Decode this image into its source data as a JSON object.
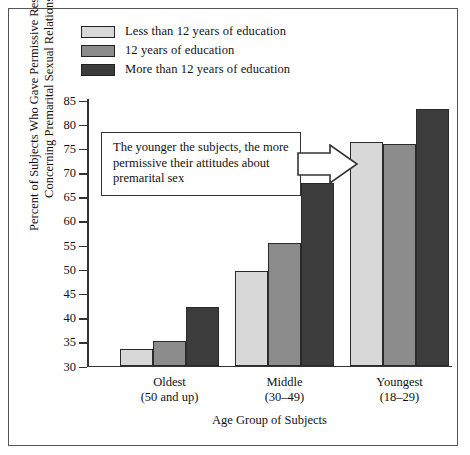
{
  "chart_data": {
    "type": "bar",
    "title": "",
    "xlabel": "Age Group of Subjects",
    "ylabel": "Percent of Subjects Who Gave Permissive Responses Concerning Premarital Sexual Relations",
    "ylabel_line1": "Percent of Subjects Who Gave Permissive Responses",
    "ylabel_line2": "Concerning Premarital Sexual Relations",
    "ylim": [
      30,
      85
    ],
    "ytick_step": 5,
    "yticks": [
      "85",
      "80",
      "75",
      "70",
      "65",
      "60",
      "55",
      "50",
      "45",
      "40",
      "35",
      "30"
    ],
    "grid": false,
    "legend_position": "top-left",
    "categories": [
      "Oldest",
      "Middle",
      "Youngest"
    ],
    "category_sublabels": [
      "(50 and up)",
      "(30–49)",
      "(18–29)"
    ],
    "series": [
      {
        "name": "Less than 12 years of education",
        "color": "#d8d8d8",
        "values": [
          33.5,
          49.5,
          76.3
        ]
      },
      {
        "name": "12 years of education",
        "color": "#8c8c8c",
        "values": [
          35.0,
          55.3,
          75.7
        ]
      },
      {
        "name": "More than 12 years of education",
        "color": "#3c3c3c",
        "values": [
          42.0,
          67.8,
          83.0
        ]
      }
    ],
    "annotations": [
      {
        "text": "The younger the subjects, the more permissive their attitudes about premarital sex",
        "line1": "The younger the subjects, the more",
        "line2": "permissive their attitudes about",
        "line3": "premarital sex",
        "arrow": "block-arrow-right"
      }
    ]
  },
  "legend": {
    "items": [
      {
        "label": "Less than 12 years of education",
        "color": "#d8d8d8"
      },
      {
        "label": "12 years of education",
        "color": "#8c8c8c"
      },
      {
        "label": "More than 12 years of education",
        "color": "#3c3c3c"
      }
    ]
  }
}
